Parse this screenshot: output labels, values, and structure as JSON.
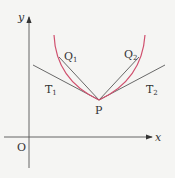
{
  "diagram": {
    "axes": {
      "x_label": "x",
      "y_label": "y",
      "origin_label": "O"
    },
    "point": {
      "label": "P"
    },
    "chords": [
      {
        "label": "Q",
        "sub": "1"
      },
      {
        "label": "Q",
        "sub": "2"
      }
    ],
    "tangents": [
      {
        "label": "T",
        "sub": "1"
      },
      {
        "label": "T",
        "sub": "2"
      }
    ],
    "colors": {
      "curve": "#d0506e",
      "lines": "#444444",
      "background": "#f5f5f3"
    }
  }
}
